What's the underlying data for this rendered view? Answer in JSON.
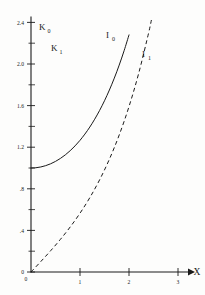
{
  "chart_data": {
    "type": "line",
    "title": "",
    "subtitle": "",
    "xlabel": "X",
    "ylabel": "",
    "xlim": [
      0,
      3.2
    ],
    "ylim": [
      0,
      2.55
    ],
    "grid": false,
    "legend_position": "inline-curve-labels",
    "x_ticks": [
      "0",
      "1",
      "2",
      "3"
    ],
    "x_tick_values": [
      0,
      1,
      2,
      3
    ],
    "y_ticks": [
      "0",
      ".4",
      ".8",
      "1.2",
      "1.6",
      "2.0",
      "2.4"
    ],
    "y_tick_values": [
      0,
      0.4,
      0.8,
      1.2,
      1.6,
      2.0,
      2.4
    ],
    "y_minor_tick_values": [
      0.2,
      0.6,
      1.0,
      1.4,
      1.8,
      2.2
    ],
    "axis_origin_label": "0",
    "series": [
      {
        "name": "I₀",
        "label": "I",
        "subscript": "0",
        "style": "solid",
        "color": "#1a1a1a",
        "x": [
          0,
          0.1,
          0.2,
          0.3,
          0.4,
          0.5,
          0.6,
          0.7,
          0.8,
          0.9,
          1.0,
          1.1,
          1.2,
          1.3,
          1.4,
          1.5,
          1.6,
          1.7,
          1.8,
          1.9,
          2.0
        ],
        "values": [
          1.0,
          1.0025,
          1.01,
          1.0226,
          1.0404,
          1.0635,
          1.092,
          1.1263,
          1.1665,
          1.213,
          1.2661,
          1.3262,
          1.3937,
          1.4693,
          1.5534,
          1.6467,
          1.75,
          1.864,
          1.9896,
          2.1277,
          2.2796
        ],
        "label_position": {
          "x": 1.45,
          "y": 2.42
        }
      },
      {
        "name": "I₁",
        "label": "I",
        "subscript": "1",
        "style": "dashed",
        "color": "#1a1a1a",
        "x": [
          0,
          0.2,
          0.4,
          0.6,
          0.8,
          1.0,
          1.2,
          1.4,
          1.6,
          1.8,
          2.0,
          2.2,
          2.4,
          2.5
        ],
        "values": [
          0,
          0.1005,
          0.204,
          0.3137,
          0.4329,
          0.5652,
          0.7147,
          0.8861,
          1.0848,
          1.3172,
          1.5906,
          1.9141,
          2.2981,
          2.5167
        ],
        "label_position": {
          "x": 2.05,
          "y": 2.24
        }
      },
      {
        "name": "K₀",
        "label": "K",
        "subscript": "0",
        "style": "solid",
        "color": "#1a1a1a",
        "x": [
          0.09,
          0.15,
          0.2,
          0.3,
          0.4,
          0.5,
          0.6,
          0.8,
          1.0,
          1.2,
          1.4,
          1.6,
          1.8,
          2.0,
          2.2,
          2.4,
          2.6,
          2.8,
          3.0
        ],
        "values": [
          2.5,
          2.03,
          1.7527,
          1.3725,
          1.1145,
          0.9244,
          0.7775,
          0.5653,
          0.421,
          0.3185,
          0.2437,
          0.188,
          0.1459,
          0.1139,
          0.0893,
          0.0702,
          0.0554,
          0.0438,
          0.0347
        ],
        "label_position": {
          "x": 0.17,
          "y": 2.47
        }
      },
      {
        "name": "K₁",
        "label": "K",
        "subscript": "1",
        "style": "dashed",
        "color": "#1a1a1a",
        "x": [
          0.22,
          0.3,
          0.4,
          0.5,
          0.6,
          0.8,
          1.0,
          1.2,
          1.4,
          1.6,
          1.8,
          2.0,
          2.2,
          2.4,
          2.6,
          2.8,
          3.0
        ],
        "values": [
          2.5,
          2.079,
          1.6564,
          1.3872,
          1.1919,
          0.8618,
          0.6019,
          0.4346,
          0.3208,
          0.2406,
          0.1826,
          0.1399,
          0.1079,
          0.0837,
          0.0653,
          0.0511,
          0.0402
        ],
        "label_position": {
          "x": 0.62,
          "y": 2.28
        }
      }
    ]
  },
  "axes": {
    "x_axis_title": "X",
    "origin_label": "0"
  }
}
